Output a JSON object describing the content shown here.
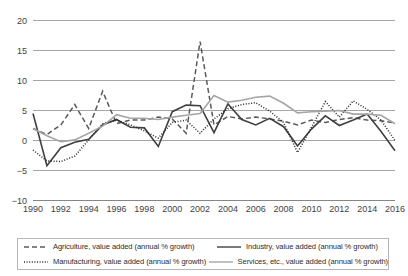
{
  "chart_data": {
    "type": "line",
    "title": "",
    "xlabel": "",
    "ylabel": "",
    "ylim": [
      -10,
      20
    ],
    "ytick_values": [
      20,
      15,
      10,
      5,
      0,
      -5,
      -10
    ],
    "ytick_labels": [
      "20",
      "15",
      "10",
      "5",
      "0",
      "-5",
      "-10"
    ],
    "grid": true,
    "legend_position": "bottom",
    "x": [
      1990,
      1991,
      1992,
      1993,
      1994,
      1995,
      1996,
      1997,
      1998,
      1999,
      2000,
      2001,
      2002,
      2003,
      2004,
      2005,
      2006,
      2007,
      2008,
      2009,
      2010,
      2011,
      2012,
      2013,
      2014,
      2015,
      2016
    ],
    "xtick_values": [
      1990,
      1992,
      1994,
      1996,
      1998,
      2000,
      2002,
      2004,
      2006,
      2008,
      2010,
      2012,
      2014,
      2016
    ],
    "xtick_labels": [
      "1990",
      "1992",
      "1994",
      "1996",
      "1998",
      "2000",
      "2002",
      "2004",
      "2006",
      "2008",
      "2010",
      "2012",
      "2014",
      "2016"
    ],
    "series": [
      {
        "name": "Agriculture, value added (annual % growth)",
        "style": "dashed",
        "color": "#595959",
        "values": [
          2.0,
          1.0,
          2.6,
          6.0,
          2.0,
          8.2,
          2.8,
          3.4,
          3.4,
          3.9,
          3.6,
          1.2,
          16.5,
          2.6,
          4.0,
          3.6,
          3.9,
          3.6,
          3.2,
          2.6,
          3.4,
          3.0,
          3.5,
          3.8,
          3.4,
          3.3,
          2.9
        ]
      },
      {
        "name": "Industry, value added (annual % growth)",
        "style": "solid",
        "color": "#404040",
        "values": [
          4.5,
          -4.2,
          -1.2,
          -0.3,
          0.2,
          2.6,
          3.5,
          2.2,
          2.1,
          -1.0,
          4.8,
          5.9,
          5.8,
          1.3,
          6.1,
          3.5,
          2.6,
          3.7,
          2.3,
          -0.9,
          1.9,
          4.1,
          2.5,
          3.4,
          4.4,
          1.5,
          -1.7
        ]
      },
      {
        "name": "Manufacturing, value added (annual % growth)",
        "style": "dotted",
        "color": "#262626",
        "values": [
          -1.6,
          -3.4,
          -3.5,
          -2.6,
          0.1,
          2.8,
          3.4,
          2.6,
          1.6,
          0.4,
          3.0,
          3.4,
          1.2,
          3.6,
          5.3,
          6.0,
          6.3,
          4.9,
          3.0,
          -2.0,
          2.2,
          6.5,
          3.9,
          6.6,
          5.2,
          3.4,
          0.0
        ]
      },
      {
        "name": "Services, etc., value added (annual % growth)",
        "style": "solid-light",
        "color": "#a5a5a5",
        "values": [
          2.0,
          0.8,
          -0.2,
          0.1,
          1.2,
          2.4,
          4.3,
          3.7,
          3.7,
          3.5,
          3.9,
          4.2,
          4.5,
          7.5,
          6.4,
          6.7,
          7.2,
          7.4,
          6.2,
          4.6,
          4.8,
          4.9,
          5.0,
          4.4,
          4.4,
          4.2,
          2.8
        ]
      }
    ]
  },
  "legend": {
    "entries": [
      {
        "label": "Agriculture, value added (annual % growth)",
        "style": "dashed",
        "color": "#595959"
      },
      {
        "label": "Industry, value added (annual % growth)",
        "style": "solid",
        "color": "#404040"
      },
      {
        "label": "Manufacturing, value added (annual % growth)",
        "style": "dotted",
        "color": "#262626"
      },
      {
        "label": "Services, etc., value added (annual % growth)",
        "style": "solid-light",
        "color": "#a5a5a5"
      }
    ]
  }
}
